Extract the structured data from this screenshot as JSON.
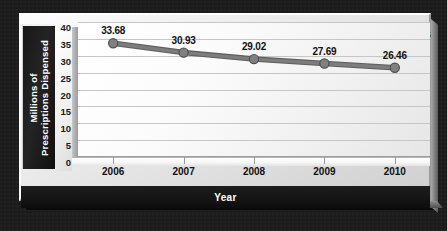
{
  "chart_data": {
    "type": "line",
    "title": "Estrogens",
    "xlabel": "Year",
    "ylabel": "Millions of Prescriptions Dispensed",
    "ylabel_line1": "Millions of",
    "ylabel_line2": "Prescriptions Dispensed",
    "categories": [
      "2006",
      "2007",
      "2008",
      "2009",
      "2010"
    ],
    "values": [
      33.68,
      30.93,
      29.02,
      27.69,
      26.46
    ],
    "point_labels": [
      "33.68",
      "30.93",
      "29.02",
      "27.69",
      "26.46"
    ],
    "yticks": [
      40,
      35,
      30,
      25,
      20,
      15,
      10,
      5,
      0
    ],
    "ytick_labels": [
      "40",
      "35",
      "30",
      "25",
      "20",
      "15",
      "10",
      "5",
      "0"
    ],
    "ylim": [
      0,
      40
    ],
    "grid": true,
    "legend": "none",
    "series": [
      {
        "name": "Estrogens",
        "values": [
          33.68,
          30.93,
          29.02,
          27.69,
          26.46
        ]
      }
    ],
    "colors": {
      "line": "#7d7d7d",
      "line_edge": "#5e5e5e",
      "marker": "#808080",
      "marker_edge": "#4f4f4f",
      "plot_background": "#f5f5f5",
      "gridline": "#c6c6c6",
      "panel_background": "#1b1b1b",
      "axis_title_text": "#ffffff",
      "label_text": "#111111"
    }
  }
}
